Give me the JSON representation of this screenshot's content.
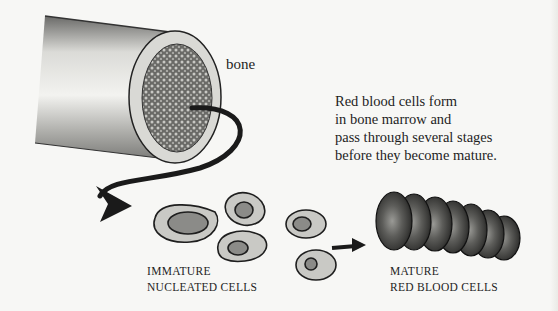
{
  "diagram": {
    "labels": {
      "bone": "bone",
      "description": [
        "Red blood cells form",
        "in bone marrow and",
        "pass through several stages",
        "before they become mature."
      ],
      "immature": [
        "IMMATURE",
        "NUCLEATED CELLS"
      ],
      "mature": [
        "MATURE",
        "RED BLOOD CELLS"
      ]
    },
    "nodes": [
      {
        "id": "bone",
        "label": "bone",
        "depiction": "cut long bone showing marrow"
      },
      {
        "id": "immature",
        "label": "IMMATURE NUCLEATED CELLS",
        "count": 5
      },
      {
        "id": "mature",
        "label": "MATURE RED BLOOD CELLS",
        "count": 7
      }
    ],
    "edges": [
      {
        "from": "bone",
        "to": "immature",
        "style": "curved arrow"
      },
      {
        "from": "immature",
        "to": "mature",
        "style": "straight arrow"
      }
    ],
    "colors": {
      "background": "#f7f7f5",
      "ink": "#1e1e1e",
      "cell_fill": "#c9c9c5",
      "marrow": "#5a5a58"
    }
  }
}
